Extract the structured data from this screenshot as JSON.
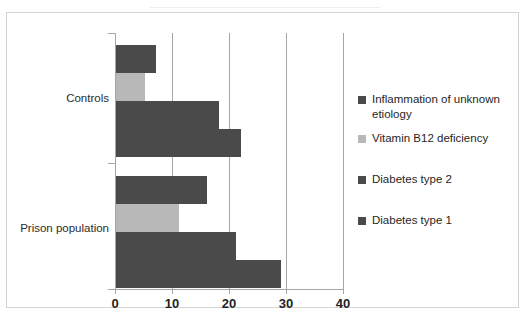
{
  "chart_data": {
    "type": "bar",
    "orientation": "horizontal",
    "title": "",
    "xlabel": "",
    "ylabel": "",
    "xlim": [
      0,
      40
    ],
    "xticks": [
      0,
      10,
      20,
      30,
      40
    ],
    "xtick_labels": [
      "0",
      "10",
      "20",
      "30",
      "40"
    ],
    "grid": "vertical",
    "legend_position": "right",
    "categories": [
      "Controls",
      "Prison population"
    ],
    "series": [
      {
        "name": "Inflammation of unknown etiology",
        "color": "#4a4a4a",
        "values": [
          7,
          16
        ]
      },
      {
        "name": "Vitamin B12 deficiency",
        "color": "#b8b8b8",
        "values": [
          5,
          11
        ]
      },
      {
        "name": "Diabetes type 2",
        "color": "#4a4a4a",
        "values": [
          18,
          21
        ]
      },
      {
        "name": "Diabetes type 1",
        "color": "#4a4a4a",
        "values": [
          22,
          29
        ]
      }
    ]
  },
  "legend": {
    "items": [
      {
        "label": "Inflammation of unknown etiology",
        "color": "#4a4a4a"
      },
      {
        "label": "Vitamin B12 deficiency",
        "color": "#b8b8b8"
      },
      {
        "label": "Diabetes type 2",
        "color": "#4a4a4a"
      },
      {
        "label": "Diabetes type 1",
        "color": "#4a4a4a"
      }
    ]
  },
  "axis": {
    "category_labels": [
      "Controls",
      "Prison population"
    ],
    "x_tick_labels": [
      "0",
      "10",
      "20",
      "30",
      "40"
    ]
  }
}
